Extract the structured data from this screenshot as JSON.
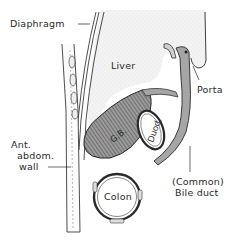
{
  "diagram": {
    "type": "anatomical sagittal section",
    "colors": {
      "ink": "#2a2a2a",
      "liver_fill": "#f1f1f1",
      "gallbladder_fill": "#8a8a8a",
      "background": "#ffffff"
    },
    "labels": {
      "diaphragm": "Diaphragm",
      "liver": "Liver",
      "porta": "Porta",
      "gallbladder": "G.B.",
      "duodenum": "Duod.",
      "abdominal_wall_line1": "Ant.",
      "abdominal_wall_line2": "abdom.",
      "abdominal_wall_line3": "wall",
      "colon": "Colon",
      "bile_duct_line1": "(Common)",
      "bile_duct_line2": "Bile duct"
    }
  }
}
